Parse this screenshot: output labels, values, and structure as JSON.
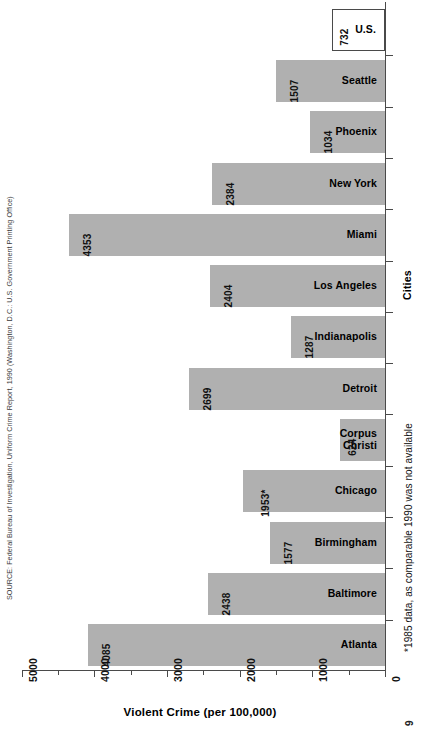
{
  "chart_data": {
    "type": "bar",
    "orientation": "horizontal-rotated",
    "title": "",
    "xlabel": "Violent Crime  (per 100,000)",
    "ylabel": "Cities",
    "xlim": [
      0,
      5000
    ],
    "xticks": [
      "5000",
      "4000",
      "3000",
      "2000",
      "1000",
      "0"
    ],
    "xtick_values": [
      5000,
      4000,
      3000,
      2000,
      1000,
      0
    ],
    "axis_reversed": true,
    "grid": false,
    "legend": null,
    "categories": [
      "U.S.",
      "Seattle",
      "Phoenix",
      "New York",
      "Miami",
      "Los Angeles",
      "Indianapolis",
      "Detroit",
      "Corpus\nChristi",
      "Chicago",
      "Birmingham",
      "Baltimore",
      "Atlanta"
    ],
    "values": [
      732,
      1507,
      1034,
      2384,
      4353,
      2404,
      1287,
      2699,
      624,
      1953,
      1577,
      2438,
      4085
    ],
    "value_labels": [
      "732",
      "1507",
      "1034",
      "2384",
      "4353",
      "2404",
      "1287",
      "2699",
      "624",
      "1953*",
      "1577",
      "2438",
      "4085"
    ],
    "bar_styles": [
      "hollow",
      "filled",
      "filled",
      "filled",
      "filled",
      "filled",
      "filled",
      "filled",
      "filled",
      "filled",
      "filled",
      "filled",
      "filled"
    ],
    "colors": {
      "bar_fill": "#b0b0b0",
      "bar_outline": "#4a4a4a",
      "axis": "#4a4a4a",
      "text": "#000000"
    },
    "annotations": [
      "*1985 data, as comparable 1990 was not available"
    ]
  },
  "bars": [
    {
      "label": "U.S.",
      "value_label": "732",
      "value": 732,
      "style": "hollow"
    },
    {
      "label": "Seattle",
      "value_label": "1507",
      "value": 1507,
      "style": "filled"
    },
    {
      "label": "Phoenix",
      "value_label": "1034",
      "value": 1034,
      "style": "filled"
    },
    {
      "label": "New York",
      "value_label": "2384",
      "value": 2384,
      "style": "filled"
    },
    {
      "label": "Miami",
      "value_label": "4353",
      "value": 4353,
      "style": "filled"
    },
    {
      "label": "Los Angeles",
      "value_label": "2404",
      "value": 2404,
      "style": "filled"
    },
    {
      "label": "Indianapolis",
      "value_label": "1287",
      "value": 1287,
      "style": "filled"
    },
    {
      "label": "Detroit",
      "value_label": "2699",
      "value": 2699,
      "style": "filled"
    },
    {
      "label": "Corpus\nChristi",
      "value_label": "624",
      "value": 624,
      "style": "filled"
    },
    {
      "label": "Chicago",
      "value_label": "1953*",
      "value": 1953,
      "style": "filled"
    },
    {
      "label": "Birmingham",
      "value_label": "1577",
      "value": 1577,
      "style": "filled"
    },
    {
      "label": "Baltimore",
      "value_label": "2438",
      "value": 2438,
      "style": "filled"
    },
    {
      "label": "Atlanta",
      "value_label": "4085",
      "value": 4085,
      "style": "filled"
    }
  ],
  "axes": {
    "value_axis_title": "Violent Crime  (per 100,000)",
    "category_axis_title": "Cities",
    "value_ticks": [
      "5000",
      "4000",
      "3000",
      "2000",
      "1000",
      "0"
    ]
  },
  "notes": {
    "footnote": "*1985 data, as comparable 1990 was not available",
    "source": "SOURCE: Federal Bureau of Investigation, Uniform Crime Report, 1990 (Washington, D.C.: U.S. Government Printing Office)",
    "page_number": "9"
  }
}
